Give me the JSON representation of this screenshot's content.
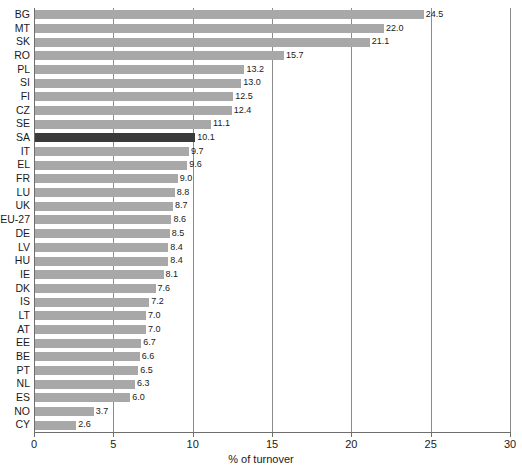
{
  "chart_data": {
    "type": "bar",
    "orientation": "horizontal",
    "title": "",
    "xlabel": "% of turnover",
    "ylabel": "",
    "xlim": [
      0,
      30
    ],
    "xticks": [
      0,
      5,
      10,
      15,
      20,
      25,
      30
    ],
    "xtick_labels": [
      "0",
      "5",
      "10",
      "15",
      "20",
      "25",
      "30"
    ],
    "grid": "vertical",
    "legend": "none",
    "highlight_category": "SA",
    "colors": {
      "bar": "#a8a8a8",
      "bar_highlight": "#3a3a3a",
      "gridline": "#8c8c8c",
      "axis": "#6e6e6e",
      "text": "#1a1a1a",
      "background": "#ffffff"
    },
    "categories": [
      "BG",
      "MT",
      "SK",
      "RO",
      "PL",
      "SI",
      "FI",
      "CZ",
      "SE",
      "SA",
      "IT",
      "EL",
      "FR",
      "LU",
      "UK",
      "EU-27",
      "DE",
      "LV",
      "HU",
      "IE",
      "DK",
      "IS",
      "LT",
      "AT",
      "EE",
      "BE",
      "PT",
      "NL",
      "ES",
      "NO",
      "CY"
    ],
    "values": [
      24.5,
      22.0,
      21.1,
      15.7,
      13.2,
      13.0,
      12.5,
      12.4,
      11.1,
      10.1,
      9.7,
      9.6,
      9.0,
      8.8,
      8.7,
      8.6,
      8.5,
      8.4,
      8.4,
      8.1,
      7.6,
      7.2,
      7.0,
      7.0,
      6.7,
      6.6,
      6.5,
      6.3,
      6.0,
      3.7,
      2.6
    ],
    "value_labels": [
      "24.5",
      "22.0",
      "21.1",
      "15.7",
      "13.2",
      "13.0",
      "12.5",
      "12.4",
      "11.1",
      "10.1",
      "9.7",
      "9.6",
      "9.0",
      "8.8",
      "8.7",
      "8.6",
      "8.5",
      "8.4",
      "8.4",
      "8.1",
      "7.6",
      "7.2",
      "7.0",
      "7.0",
      "6.7",
      "6.6",
      "6.5",
      "6.3",
      "6.0",
      "3.7",
      "2.6"
    ]
  }
}
